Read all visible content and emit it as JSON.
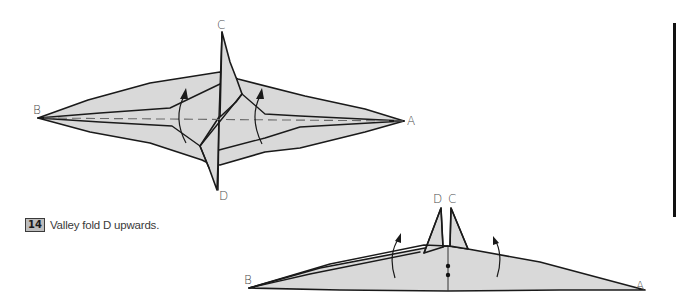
{
  "figure_top": {
    "labels": {
      "b": "B",
      "a": "A",
      "c": "C",
      "d": "D"
    }
  },
  "figure_bottom": {
    "labels": {
      "b": "B",
      "a": "A",
      "c": "C",
      "d": "D"
    }
  },
  "instruction": {
    "step_number": "14",
    "text": "Valley fold D upwards."
  },
  "colors": {
    "paper_fill": "#d9d9d9",
    "line": "#1a1a1a",
    "step_badge_bg": "#bdbdbd",
    "margin_bar": "#111111"
  }
}
